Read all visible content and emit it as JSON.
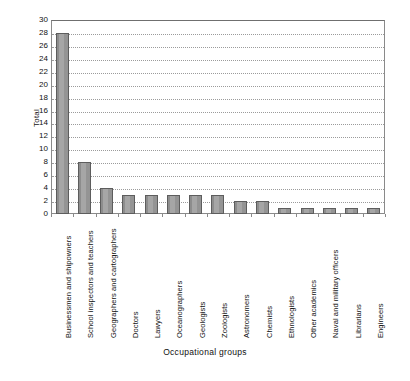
{
  "chart_data": {
    "type": "bar",
    "title": "",
    "xlabel": "Occupational groups",
    "ylabel": "Total",
    "ylim": [
      0,
      30
    ],
    "ytick_step": 2,
    "yticks": [
      0,
      2,
      4,
      6,
      8,
      10,
      12,
      14,
      16,
      18,
      20,
      22,
      24,
      26,
      28,
      30
    ],
    "grid": true,
    "grid_style": "dotted-horizontal",
    "legend": "none",
    "bar_color": "#9a9a9a",
    "bar_edge_color": "#5d5d5d",
    "frame_color": "#8a8a8a",
    "categories": [
      "Businessmen and shipowners",
      "School inspectors and teachers",
      "Geographers and cartographers",
      "Doctors",
      "Lawyers",
      "Oceanographers",
      "Geologists",
      "Zoologists",
      "Astronomers",
      "Chemists",
      "Ethnologists",
      "Other academics",
      "Naval and military officers",
      "Librarians",
      "Engineers"
    ],
    "values": [
      28,
      8,
      4,
      3,
      3,
      3,
      3,
      3,
      2,
      2,
      1,
      1,
      1,
      1,
      1
    ]
  }
}
